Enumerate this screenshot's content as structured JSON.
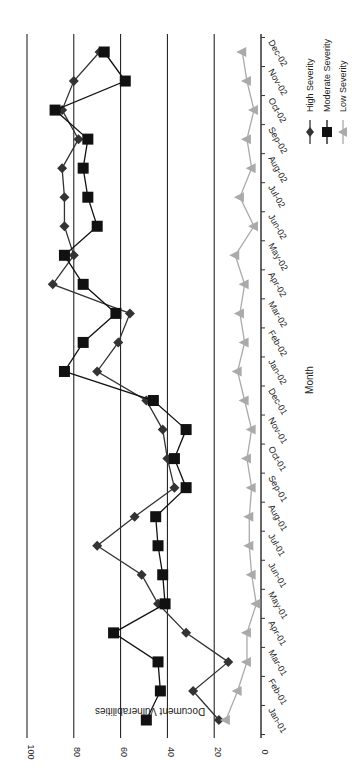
{
  "chart_data": {
    "type": "line",
    "orientation": "rotated-90-clockwise",
    "title": "",
    "xlabel": "Month",
    "ylabel": "Document Vulnerabilities",
    "ylim": [
      0,
      100
    ],
    "yticks": [
      "0",
      "20",
      "40",
      "60",
      "80",
      "100"
    ],
    "grid": true,
    "legend_position": "right",
    "categories": [
      "Jan-01",
      "Feb-01",
      "Mar-01",
      "Apr-01",
      "May-01",
      "Jun-01",
      "Jul-01",
      "Aug-01",
      "Sep-01",
      "Oct-01",
      "Nov-01",
      "Dec-01",
      "Jan-02",
      "Feb-02",
      "Mar-02",
      "Apr-02",
      "May-02",
      "Jun-02",
      "Jul-02",
      "Aug-02",
      "Sep-02",
      "Oct-02",
      "Nov-02",
      "Dec-02"
    ],
    "series": [
      {
        "name": "High Severity",
        "marker": "diamond",
        "color": "#333333",
        "values": [
          18,
          29,
          14,
          32,
          44,
          51,
          70,
          54,
          37,
          40,
          42,
          49,
          70,
          61,
          56,
          89,
          80,
          84,
          84,
          85,
          78,
          85,
          80,
          69
        ]
      },
      {
        "name": "Moderate Severity",
        "marker": "square",
        "color": "#111111",
        "values": [
          49,
          43,
          44,
          63,
          41,
          42,
          44,
          45,
          32,
          37,
          32,
          46,
          84,
          76,
          62,
          76,
          84,
          70,
          74,
          76,
          74,
          88,
          58,
          67
        ]
      },
      {
        "name": "Low Severity",
        "marker": "triangle",
        "color": "#aaaaaa",
        "values": [
          15,
          10,
          6,
          6,
          2,
          4,
          5,
          5,
          4,
          6,
          4,
          7,
          10,
          7,
          9,
          7,
          11,
          3,
          9,
          4,
          6,
          3,
          6,
          8
        ]
      }
    ]
  }
}
